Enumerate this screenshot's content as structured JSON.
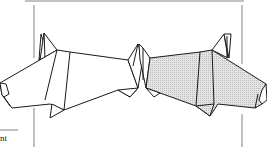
{
  "figure": {
    "left_model": {
      "label": "left-origami-animal",
      "fill": "#ffffff"
    },
    "right_model": {
      "label": "right-origami-animal",
      "fill": "#dcdcdc",
      "pattern": "screen-tone"
    },
    "stroke_color": "#1a1a1a",
    "frame_color": "#555555"
  },
  "caption": {
    "text": "nt"
  }
}
